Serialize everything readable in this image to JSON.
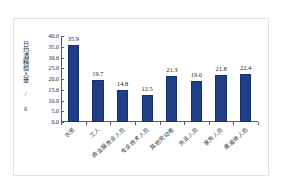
{
  "chart_data": {
    "type": "bar",
    "title": "",
    "subtitle": "",
    "xlabel": "",
    "ylabel": "日均酒精摄入量 / g",
    "categories": [
      "农民",
      "工人",
      "商业服务业人员",
      "专业技术人员",
      "其他劳动者",
      "失业人员",
      "家务人员",
      "离退休人员"
    ],
    "values": [
      35.9,
      19.7,
      14.8,
      12.5,
      21.3,
      19.0,
      21.8,
      22.4
    ],
    "value_labels": [
      "35.9",
      "19.7",
      "14.8",
      "12.5",
      "21.3",
      "19.0",
      "21.8",
      "22.4"
    ],
    "ylim": [
      0.0,
      40.0
    ],
    "ytick_step": 5.0,
    "yticks": [
      "0.0",
      "5.0",
      "10.0",
      "15.0",
      "20.0",
      "25.0",
      "30.0",
      "35.0",
      "40.0"
    ],
    "grid": false,
    "legend": false,
    "legend_position": "none",
    "series": [
      {
        "name": "日均酒精摄入量",
        "values": [
          35.9,
          19.7,
          14.8,
          12.5,
          21.3,
          19.0,
          21.8,
          22.4
        ]
      }
    ]
  },
  "colors": {
    "bar": "#1F3F87",
    "bar_edge": "#15306B",
    "axis": "#5A5A5A",
    "text": "#222222",
    "frame": "#E2E2E2",
    "background": "#FFFFFF"
  }
}
